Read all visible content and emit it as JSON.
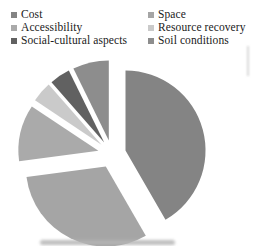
{
  "chart_data": {
    "type": "pie",
    "title": "",
    "legend_position": "top",
    "legend_columns": 2,
    "exploded": true,
    "background_color": "#ffffff",
    "text_color": "#212121",
    "slices": [
      {
        "label": "Cost",
        "value": 40,
        "color": "#848484"
      },
      {
        "label": "Space",
        "value": 30,
        "color": "#a5a5a5"
      },
      {
        "label": "Accessibility",
        "value": 11,
        "color": "#aaaaaa"
      },
      {
        "label": "Resource recovery",
        "value": 4,
        "color": "#cacaca"
      },
      {
        "label": "Social-cultural aspects",
        "value": 4,
        "color": "#616161"
      },
      {
        "label": "Soil conditions",
        "value": 7,
        "color": "#8d8d8d"
      }
    ]
  }
}
